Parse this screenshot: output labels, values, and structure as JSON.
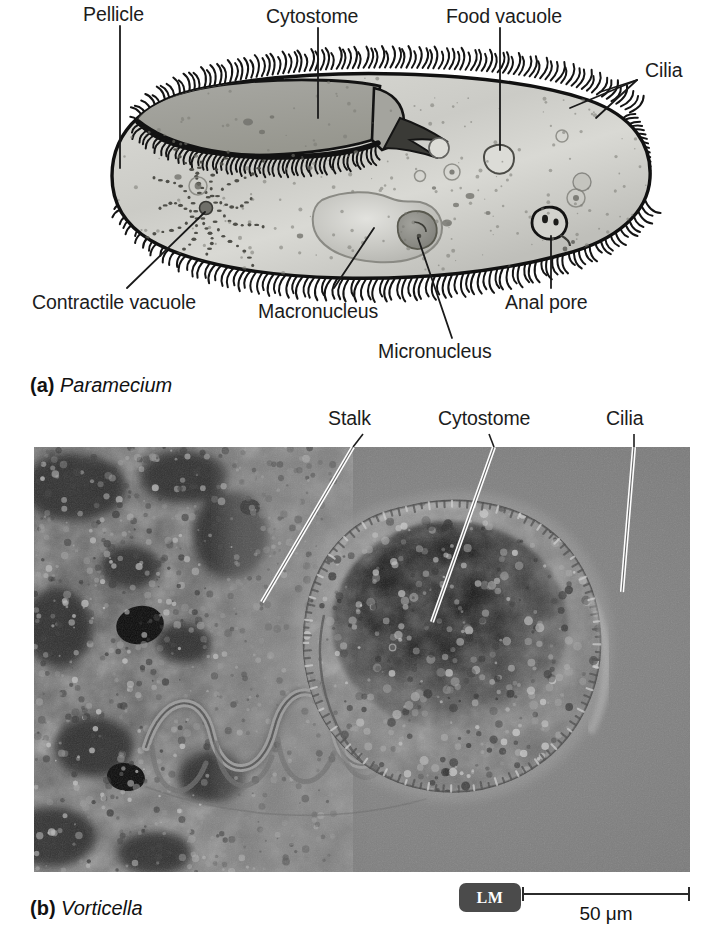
{
  "figure": {
    "background_color": "#ffffff"
  },
  "panel_a": {
    "caption_tag": "(a)",
    "caption_space": " ",
    "caption_name": "Paramecium",
    "organism": "Paramecium",
    "diagram_type": "labeled line drawing",
    "colors": {
      "cytoplasm": "#c9c9c4",
      "cytostome": "#9e9e99",
      "macronucleus": "#bdbdb8",
      "micronucleus": "#8d8d88",
      "outline": "#111111",
      "leader_line": "#1a1a1a"
    },
    "labels": [
      {
        "id": "pellicle",
        "text": "Pellicle"
      },
      {
        "id": "cytostome",
        "text": "Cytostome"
      },
      {
        "id": "food-vacuole",
        "text": "Food vacuole"
      },
      {
        "id": "cilia",
        "text": "Cilia"
      },
      {
        "id": "contractile-vacuole",
        "text": "Contractile vacuole"
      },
      {
        "id": "macronucleus",
        "text": "Macronucleus"
      },
      {
        "id": "micronucleus",
        "text": "Micronucleus"
      },
      {
        "id": "anal-pore",
        "text": "Anal pore"
      }
    ]
  },
  "panel_b": {
    "caption_tag": "(b)",
    "caption_space": " ",
    "caption_name": "Vorticella",
    "organism": "Vorticella",
    "image_type": "light micrograph",
    "colors": {
      "field": "#7e7e7e",
      "debris": "#3b3b3b",
      "leader_line": "#ffffff",
      "border": "#2a2a2a"
    },
    "labels": [
      {
        "id": "stalk",
        "text": "Stalk"
      },
      {
        "id": "cytostome",
        "text": "Cytostome"
      },
      {
        "id": "cilia",
        "text": "Cilia"
      }
    ],
    "micrograph_badge": "LM",
    "scale_bar": {
      "value": "50",
      "unit": "μm",
      "text": "50 μm",
      "length_px": 168
    }
  }
}
